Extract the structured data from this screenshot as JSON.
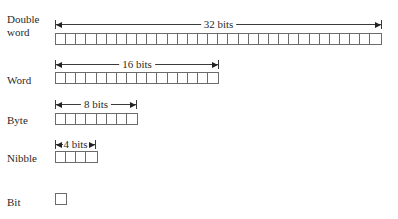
{
  "diagram": {
    "rows": [
      {
        "name": "double-word",
        "label_line1": "Double",
        "label_line2": "word",
        "bits": 32,
        "dimension_label": "32 bits"
      },
      {
        "name": "word",
        "label": "Word",
        "bits": 16,
        "dimension_label": "16 bits"
      },
      {
        "name": "byte",
        "label": "Byte",
        "bits": 8,
        "dimension_label": "8 bits"
      },
      {
        "name": "nibble",
        "label": "Nibble",
        "bits": 4,
        "dimension_label": "4 bits"
      },
      {
        "name": "bit",
        "label": "Bit",
        "bits": 1
      }
    ],
    "colors": {
      "box_stroke": "#6b6b6b",
      "text": "#2a2a2a",
      "arrow": "#222222",
      "background": "#ffffff"
    }
  }
}
